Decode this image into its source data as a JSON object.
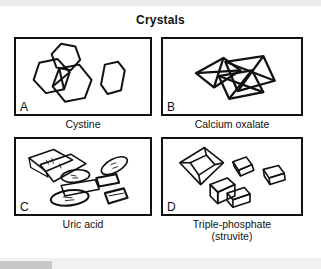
{
  "figure": {
    "title": "Crystals",
    "panels": [
      {
        "letter": "A",
        "caption": "Cystine",
        "caption_line2": "",
        "crystal_shape": "hexagonal-plates"
      },
      {
        "letter": "B",
        "caption": "Calcium oxalate",
        "caption_line2": "",
        "crystal_shape": "envelope-octahedra"
      },
      {
        "letter": "C",
        "caption": "Uric acid",
        "caption_line2": "",
        "crystal_shape": "rhomboid-plates-and-ovals"
      },
      {
        "letter": "D",
        "caption": "Triple-phosphate",
        "caption_line2": "(struvite)",
        "crystal_shape": "coffin-lid-prisms"
      }
    ]
  },
  "colors": {
    "ink": "#111111",
    "paper": "#ffffff",
    "scan_band": "#eceaea"
  }
}
